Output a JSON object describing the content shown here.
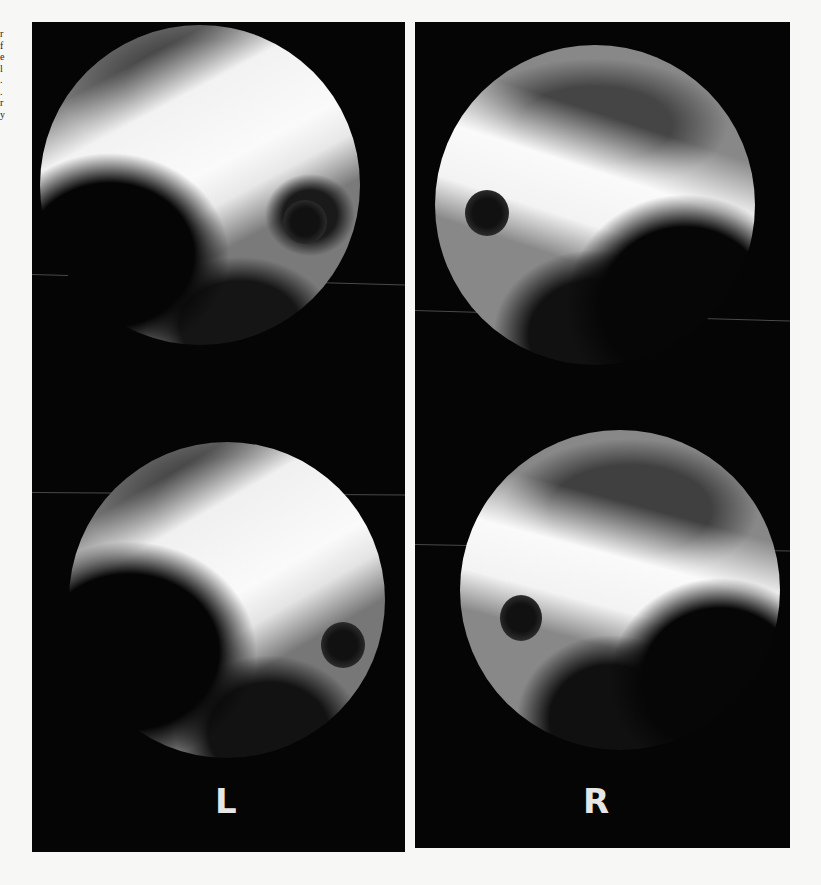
{
  "figure": {
    "panels": [
      {
        "side": "left",
        "label": "L",
        "views": [
          {
            "position": "top",
            "description": "endoscopic circular view, bright band crossing, dark round opening at right"
          },
          {
            "position": "bottom",
            "description": "endoscopic circular view, bright band crossing, dark round opening at right"
          }
        ]
      },
      {
        "side": "right",
        "label": "R",
        "views": [
          {
            "position": "top",
            "description": "endoscopic circular view, bright arc band, dark round opening at left"
          },
          {
            "position": "bottom",
            "description": "endoscopic circular view, bright arc band, dark round opening at left"
          }
        ]
      }
    ],
    "colors": {
      "page_background": "#f7f7f5",
      "panel_background": "#050505",
      "label_color": "#e6e6e6"
    }
  },
  "edge_text": {
    "fragment": "r\nf\ne\nl\n.\n.\nr\ny"
  }
}
